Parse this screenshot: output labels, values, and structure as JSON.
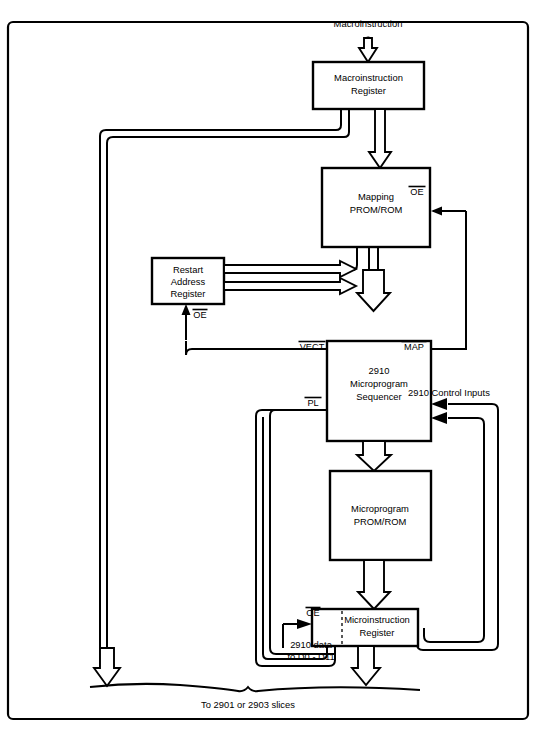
{
  "diagram": {
    "blocks": [
      {
        "id": "macroinstruction_register",
        "label_line1": "Macroinstruction",
        "label_line2": "Register"
      },
      {
        "id": "mapping_prom_rom",
        "label_line1": "Mapping",
        "label_line2": "PROM/ROM"
      },
      {
        "id": "restart_address_register",
        "label_line1": "Restart",
        "label_line2": "Address",
        "label_line3": "Register"
      },
      {
        "id": "sequencer_2910",
        "label_line1": "2910",
        "label_line2": "Microprogram",
        "label_line3": "Sequencer"
      },
      {
        "id": "microprogram_prom_rom",
        "label_line1": "Microprogram",
        "label_line2": "PROM/ROM"
      },
      {
        "id": "microinstruction_register",
        "label_line1": "Microinstruction",
        "label_line2": "Register"
      }
    ],
    "signals": {
      "macroinstruction_input": "Macroinstruction",
      "mapping_oe": "OE",
      "restart_oe": "OE",
      "vect": "VECT",
      "map": "MAP",
      "pl": "PL",
      "microinstruction_oe": "OE",
      "control_inputs": "2910 Control Inputs",
      "data_bus_line1": "2910 data",
      "data_bus_line2": "to D0 - D11",
      "bottom_brace": "To 2901 or 2903 slices"
    },
    "colors": {
      "line": "#000000",
      "fill": "#ffffff",
      "background": "#ffffff"
    }
  }
}
